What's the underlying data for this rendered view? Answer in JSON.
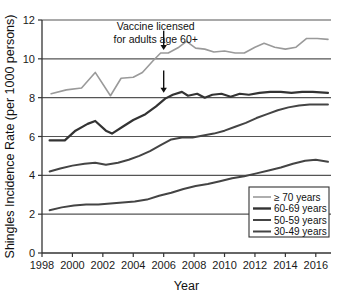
{
  "chart_data": {
    "type": "line",
    "title": "",
    "xlabel": "Year",
    "ylabel": "Shingles Incidence Rate (per 1000 persons)",
    "xlim": [
      1998,
      2017
    ],
    "ylim": [
      0,
      12
    ],
    "xticks": [
      1998,
      2000,
      2002,
      2004,
      2006,
      2008,
      2010,
      2012,
      2014,
      2016
    ],
    "yticks": [
      0,
      2,
      4,
      6,
      8,
      10,
      12
    ],
    "xtick_labels": [
      "1998",
      "2000",
      "2002",
      "2004",
      "2006",
      "2008",
      "2010",
      "2012",
      "2014",
      "2016"
    ],
    "ytick_labels": [
      "0",
      "2",
      "4",
      "6",
      "8",
      "10",
      "12"
    ],
    "grid": "horizontal",
    "legend_position": "lower-right",
    "annotations": [
      {
        "name": "vaccine-license-note",
        "line1": "Vaccine licensed",
        "line2": "for adults age 60+",
        "arrow_year": 2006,
        "arrows": [
          {
            "name": "arrow-to-70plus",
            "year": 2006,
            "from_value": 11.45,
            "to_value": 10.45
          },
          {
            "name": "arrow-to-60to69",
            "year": 2006,
            "from_value": 9.4,
            "to_value": 8.25
          }
        ]
      }
    ],
    "series": [
      {
        "name": "≥ 70 years",
        "color": "#9a9a9a",
        "width": 1.6,
        "x": [
          1998.6,
          1999.6,
          2000.6,
          2001.5,
          2002.5,
          2003.2,
          2004.0,
          2004.6,
          2005.3,
          2005.8,
          2006.3,
          2007.0,
          2007.5,
          2008.1,
          2008.7,
          2009.3,
          2010.0,
          2010.7,
          2011.3,
          2012.0,
          2012.6,
          2013.3,
          2014.0,
          2014.7,
          2015.4,
          2016.1,
          2016.8
        ],
        "y": [
          8.2,
          8.4,
          8.5,
          9.3,
          8.1,
          9.0,
          9.05,
          9.3,
          9.9,
          10.3,
          10.3,
          10.6,
          10.9,
          10.55,
          10.5,
          10.35,
          10.4,
          10.3,
          10.3,
          10.6,
          10.8,
          10.6,
          10.5,
          10.6,
          11.05,
          11.05,
          11.0
        ]
      },
      {
        "name": "60-69 years",
        "color": "#333333",
        "width": 2.2,
        "x": [
          1998.5,
          1999.5,
          2000.2,
          2001.0,
          2001.5,
          2002.2,
          2002.6,
          2003.3,
          2004.0,
          2004.8,
          2005.5,
          2006.1,
          2006.6,
          2007.2,
          2007.6,
          2008.2,
          2008.7,
          2009.2,
          2009.8,
          2010.4,
          2011.0,
          2011.6,
          2012.3,
          2013.0,
          2013.7,
          2014.4,
          2015.1,
          2015.8,
          2016.8
        ],
        "y": [
          5.8,
          5.8,
          6.3,
          6.65,
          6.8,
          6.3,
          6.15,
          6.5,
          6.85,
          7.15,
          7.55,
          7.95,
          8.15,
          8.3,
          8.1,
          8.2,
          8.0,
          8.15,
          8.2,
          8.05,
          8.2,
          8.15,
          8.25,
          8.3,
          8.3,
          8.25,
          8.3,
          8.3,
          8.25
        ]
      },
      {
        "name": "50-59 years",
        "color": "#444444",
        "width": 2.0,
        "x": [
          1998.5,
          1999.2,
          2000.0,
          2000.8,
          2001.5,
          2002.2,
          2003.0,
          2003.7,
          2004.4,
          2005.1,
          2005.8,
          2006.5,
          2007.2,
          2007.9,
          2008.6,
          2009.3,
          2010.0,
          2010.7,
          2011.4,
          2012.1,
          2012.8,
          2013.5,
          2014.2,
          2014.9,
          2015.6,
          2016.8
        ],
        "y": [
          4.2,
          4.35,
          4.5,
          4.6,
          4.65,
          4.55,
          4.65,
          4.8,
          5.0,
          5.25,
          5.55,
          5.85,
          5.95,
          5.95,
          6.05,
          6.15,
          6.3,
          6.5,
          6.7,
          6.95,
          7.15,
          7.35,
          7.5,
          7.6,
          7.65,
          7.65
        ]
      },
      {
        "name": "30-49 years",
        "color": "#444444",
        "width": 2.0,
        "x": [
          1998.5,
          1999.3,
          2000.1,
          2000.9,
          2001.7,
          2002.5,
          2003.3,
          2004.1,
          2004.9,
          2005.7,
          2006.5,
          2007.3,
          2008.1,
          2008.9,
          2009.7,
          2010.5,
          2011.3,
          2012.1,
          2012.9,
          2013.7,
          2014.5,
          2015.3,
          2016.0,
          2016.8
        ],
        "y": [
          2.2,
          2.35,
          2.45,
          2.5,
          2.5,
          2.55,
          2.6,
          2.65,
          2.75,
          2.95,
          3.1,
          3.3,
          3.45,
          3.55,
          3.7,
          3.85,
          3.95,
          4.1,
          4.25,
          4.4,
          4.6,
          4.75,
          4.8,
          4.7
        ]
      }
    ]
  },
  "legend": {
    "items": [
      {
        "label": "≥ 70 years",
        "color": "#9a9a9a",
        "width": 1.6
      },
      {
        "label": "60-69 years",
        "color": "#333333",
        "width": 2.4
      },
      {
        "label": "50-59 years",
        "color": "#444444",
        "width": 2.0
      },
      {
        "label": "30-49 years",
        "color": "#444444",
        "width": 2.0
      }
    ]
  }
}
